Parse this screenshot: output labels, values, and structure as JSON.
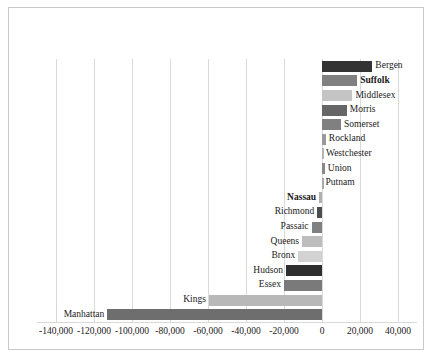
{
  "chart_data": {
    "type": "bar",
    "orientation": "horizontal",
    "title": "",
    "subtitle": "",
    "xlabel": "",
    "ylabel": "",
    "xlim": [
      -150000,
      50000
    ],
    "grid": true,
    "legend": false,
    "legend_position": "none",
    "xticks": [
      -140000,
      -120000,
      -100000,
      -80000,
      -60000,
      -40000,
      -20000,
      0,
      20000,
      40000
    ],
    "xtick_labels": [
      "-140,000",
      "-120,000",
      "-100,000",
      "-80,000",
      "-60,000",
      "-40,000",
      "-20,000",
      "0",
      "20,000",
      "40,000"
    ],
    "categories": [
      "Bergen",
      "Suffolk",
      "Middlesex",
      "Morris",
      "Somerset",
      "Rockland",
      "Westchester",
      "Union",
      "Putnam",
      "Nassau",
      "Richmond",
      "Passaic",
      "Queens",
      "Bronx",
      "Hudson",
      "Essex",
      "Kings",
      "Manhattan"
    ],
    "values": [
      26500,
      18500,
      16000,
      13000,
      10000,
      2000,
      500,
      1500,
      300,
      -1500,
      -2500,
      -5500,
      -10500,
      -12500,
      -19000,
      -20000,
      -59500,
      -113000
    ],
    "bar_colors": [
      "#333333",
      "#808080",
      "#c4c4c4",
      "#666666",
      "#808080",
      "#999999",
      "#b5b5b5",
      "#888888",
      "#aaaaaa",
      "#b0b0b0",
      "#4d4d4d",
      "#808080",
      "#bdbdbd",
      "#d2d2d2",
      "#2e2e2e",
      "#7a7a7a",
      "#b8b8b8",
      "#6e6e6e"
    ],
    "emphasized_labels": [
      "Suffolk",
      "Nassau"
    ],
    "gridline_color": "#d9d9d9",
    "background_color": "#ffffff",
    "border_color": "#c9c9c9"
  }
}
